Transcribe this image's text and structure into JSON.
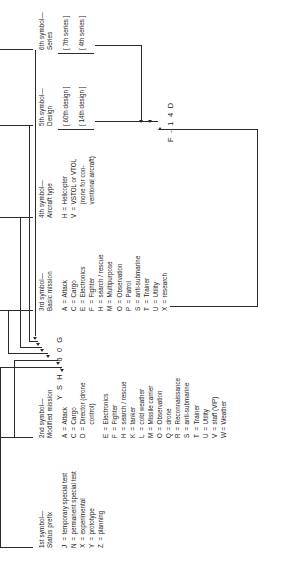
{
  "diagram": {
    "examples": {
      "primary_code": "Y S H - 6 0 G",
      "secondary_code": "F - 1 4 D"
    },
    "columns": [
      {
        "ordinal": "1st symbol—",
        "name": "Status prefix",
        "entries": [
          {
            "key": "J",
            "eq": "=",
            "value": "temporary special test"
          },
          {
            "key": "N",
            "eq": "=",
            "value": "permanent special test"
          },
          {
            "key": "X",
            "eq": "=",
            "value": "experimental"
          },
          {
            "key": "Y",
            "eq": "=",
            "value": "prototype"
          },
          {
            "key": "Z",
            "eq": "=",
            "value": "planning"
          }
        ]
      },
      {
        "ordinal": "2nd symbol—",
        "name": "Modified mission",
        "entries": [
          {
            "key": "A",
            "eq": "=",
            "value": "Attack"
          },
          {
            "key": "C",
            "eq": "=",
            "value": "Cargo"
          },
          {
            "key": "D",
            "eq": "=",
            "value": "Director (drone",
            "cont": "control)"
          },
          {
            "key": "E",
            "eq": "=",
            "value": "Electronics"
          },
          {
            "key": "F",
            "eq": "=",
            "value": "Fighter"
          },
          {
            "key": "H",
            "eq": "=",
            "value": "search / rescue"
          },
          {
            "key": "K",
            "eq": "=",
            "value": "tanker"
          },
          {
            "key": "L",
            "eq": "=",
            "value": "cold weather"
          },
          {
            "key": "M",
            "eq": "=",
            "value": "Missile carrier"
          },
          {
            "key": "O",
            "eq": "=",
            "value": "Observation"
          },
          {
            "key": "Q",
            "eq": "=",
            "value": "drone"
          },
          {
            "key": "R",
            "eq": "=",
            "value": "Reconnaissance"
          },
          {
            "key": "S",
            "eq": "=",
            "value": "anti-submarine"
          },
          {
            "key": "T",
            "eq": "=",
            "value": "Trainer"
          },
          {
            "key": "U",
            "eq": "=",
            "value": "Utility"
          },
          {
            "key": "V",
            "eq": "=",
            "value": "staff (VIP)"
          },
          {
            "key": "W",
            "eq": "=",
            "value": "Weather"
          }
        ]
      },
      {
        "ordinal": "3rd symbol—",
        "name": "Basic mission",
        "entries": [
          {
            "key": "A",
            "eq": "=",
            "value": "Attack"
          },
          {
            "key": "C",
            "eq": "=",
            "value": "Cargo"
          },
          {
            "key": "E",
            "eq": "=",
            "value": "Electronics"
          },
          {
            "key": "F",
            "eq": "=",
            "value": "Fighter"
          },
          {
            "key": "H",
            "eq": "=",
            "value": "search / rescue"
          },
          {
            "key": "M",
            "eq": "=",
            "value": "Multipurpose"
          },
          {
            "key": "O",
            "eq": "=",
            "value": "Observation"
          },
          {
            "key": "P",
            "eq": "=",
            "value": "Patrol"
          },
          {
            "key": "S",
            "eq": "=",
            "value": "anti-submarine"
          },
          {
            "key": "T",
            "eq": "=",
            "value": "Trainer"
          },
          {
            "key": "U",
            "eq": "=",
            "value": "Utility"
          },
          {
            "key": "X",
            "eq": "=",
            "value": "research"
          }
        ]
      },
      {
        "ordinal": "4th symbol—",
        "name": "Aircraft type",
        "entries": [
          {
            "key": "H",
            "eq": "=",
            "value": "Helicopter"
          },
          {
            "key": "V",
            "eq": "=",
            "value": "VSTOL or VTOL"
          },
          {
            "key": "",
            "eq": "",
            "value": "(none for con-",
            "cont": "ventional aircraft)"
          }
        ]
      },
      {
        "ordinal": "5th symbol—",
        "name": "Design",
        "brackets": [
          "[ 60th design ]",
          "[ 14th design ]"
        ]
      },
      {
        "ordinal": "6th symbol—",
        "name": "Series",
        "brackets": [
          "[ 7th series ]",
          "[ 4th series ]"
        ]
      }
    ]
  }
}
